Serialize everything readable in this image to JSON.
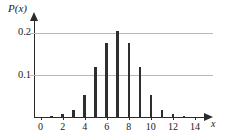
{
  "chart_data": {
    "type": "bar",
    "title": "",
    "subtitle": "",
    "xlabel": "x",
    "ylabel": "P(x)",
    "categories": [
      0,
      1,
      2,
      3,
      4,
      5,
      6,
      7,
      8,
      9,
      10,
      11,
      12,
      13,
      14
    ],
    "values": [
      0.0,
      0.004,
      0.008,
      0.018,
      0.052,
      0.118,
      0.175,
      0.205,
      0.175,
      0.118,
      0.052,
      0.018,
      0.008,
      0.004,
      0.0
    ],
    "series": [
      {
        "name": "P(x)",
        "values": [
          0.0,
          0.004,
          0.008,
          0.018,
          0.052,
          0.118,
          0.175,
          0.205,
          0.175,
          0.118,
          0.052,
          0.018,
          0.008,
          0.004,
          0.0
        ]
      }
    ],
    "xlim": [
      -0.6,
      15.0
    ],
    "ylim": [
      0,
      0.23
    ],
    "x_ticks": [
      0,
      2,
      4,
      6,
      8,
      10,
      12,
      14
    ],
    "x_tick_labels": [
      "0",
      "2",
      "4",
      "6",
      "8",
      "10",
      "12",
      "14"
    ],
    "y_ticks": [
      0.1,
      0.2
    ],
    "y_tick_labels": [
      "0.1",
      "0.2"
    ],
    "grid": "horizontal",
    "legend": "none",
    "bar_color": "#2e2e2e",
    "grid_color": "#b9b9b9",
    "axis_color": "#2b2b2b",
    "background_color": "#ffffff",
    "annotations": []
  }
}
